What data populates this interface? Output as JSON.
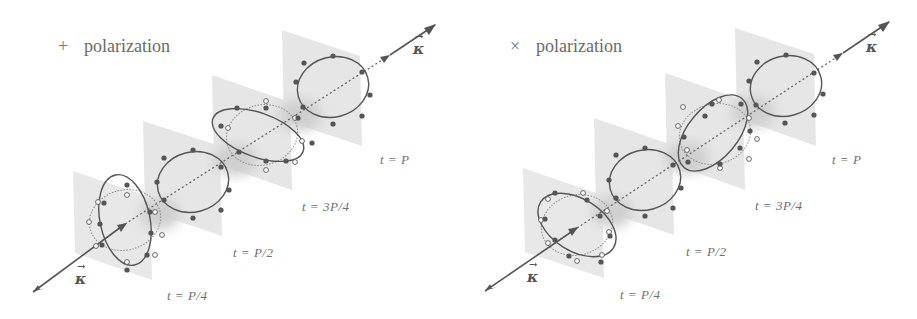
{
  "figure": {
    "panels": [
      {
        "id": "plus",
        "title_symbol": "+",
        "title_text": "polarization",
        "wave_vector_label": "κ",
        "time_labels": [
          "t = P/4",
          "t = P/2",
          "t = 3P/4",
          "t = P"
        ]
      },
      {
        "id": "cross",
        "title_symbol": "×",
        "title_text": "polarization",
        "wave_vector_label": "κ",
        "time_labels": [
          "t = P/4",
          "t = P/2",
          "t = 3P/4",
          "t = P"
        ]
      }
    ],
    "legend": {
      "filled_dots": "test particles at time t",
      "open_dots": "test particles at rest (reference circle)"
    },
    "colors": {
      "plane": "#e6e6e6",
      "plane_shadow": "#d2d2d2",
      "ring": "#555555",
      "axis": "#555555"
    }
  }
}
